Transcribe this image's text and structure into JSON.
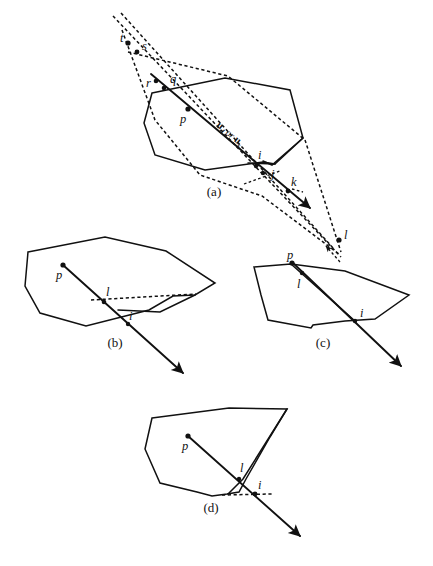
{
  "figure": {
    "background_color": "#ffffff",
    "stroke_color": "#111111",
    "panels": [
      {
        "id": "a",
        "caption": "(a)",
        "description": "Polygon with ray from p crossing multiple vertices and edges; dashed support lines meet at t and l.",
        "point_labels": [
          "t",
          "s",
          "r",
          "q",
          "p",
          "i",
          "j",
          "k",
          "l"
        ],
        "ray_label_parts": {
          "vector": "u",
          "sub1": "d",
          "conjunction": " or ",
          "sub2": "s"
        },
        "ray_label_plain": "ud or us"
      },
      {
        "id": "b",
        "caption": "(b)",
        "description": "Ray from interior point p exits through vertex l with a dashed horizontal edge; crossing point i below.",
        "point_labels": [
          "p",
          "l",
          "i"
        ]
      },
      {
        "id": "c",
        "caption": "(c)",
        "description": "Point p near the top edge; ray passes through l on the upper edge and i on the lower edge.",
        "point_labels": [
          "p",
          "l",
          "i"
        ]
      },
      {
        "id": "d",
        "caption": "(d)",
        "description": "Ray from p leaves through concave vertex region, touching l then i with a dashed horizontal line.",
        "point_labels": [
          "p",
          "l",
          "i"
        ]
      }
    ]
  },
  "labels": {
    "t": "t",
    "s": "s",
    "r": "r",
    "q": "q",
    "p": "p",
    "i": "i",
    "j": "j",
    "k": "k",
    "l": "l",
    "vec_u": "u",
    "sub_d": "d",
    "sub_s": "s",
    "or": "or"
  },
  "captions": {
    "a": "(a)",
    "b": "(b)",
    "c": "(c)",
    "d": "(d)"
  }
}
